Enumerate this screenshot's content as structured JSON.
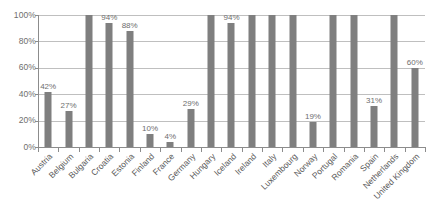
{
  "chart_data": {
    "type": "bar",
    "title": "",
    "subtitle": "",
    "xlabel": "",
    "ylabel": "",
    "ylim": [
      0,
      100
    ],
    "y_ticks": [
      "0%",
      "20%",
      "40%",
      "60%",
      "80%",
      "100%"
    ],
    "y_tick_values": [
      0,
      20,
      40,
      60,
      80,
      100
    ],
    "grid": true,
    "legend": "none",
    "bar_color": "#7f7f7f",
    "gridline_color": "#bfbfbf",
    "axis_color": "#8c8c8c",
    "label_color": "#6e6e6e",
    "categories": [
      "Austria",
      "Belgium",
      "Bulgaria",
      "Croatia",
      "Estonia",
      "Finland",
      "France",
      "Germany",
      "Hungary",
      "Iceland",
      "Ireland",
      "Italy",
      "Luxembourg",
      "Norway",
      "Portugal",
      "Romania",
      "Spain",
      "Netherlands",
      "United Kingdom"
    ],
    "values": [
      42,
      27,
      100,
      94,
      88,
      10,
      4,
      29,
      100,
      94,
      100,
      100,
      100,
      19,
      100,
      100,
      31,
      100,
      60
    ],
    "data_labels": [
      "42%",
      "27%",
      "",
      "94%",
      "88%",
      "10%",
      "4%",
      "29%",
      "",
      "94%",
      "",
      "",
      "",
      "19%",
      "",
      "",
      "31%",
      "",
      "60%"
    ]
  }
}
